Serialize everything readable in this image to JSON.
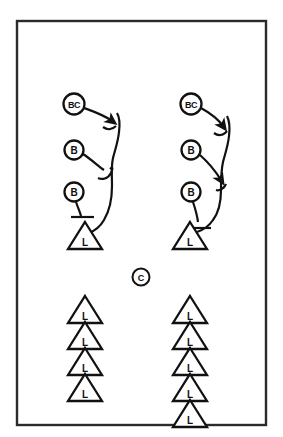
{
  "diagram": {
    "background_color": "#ffffff",
    "line_color": "#111111",
    "frame_color": "#2b2b2b",
    "frame": {
      "x": 17,
      "y": 21,
      "width": 249,
      "height": 404
    },
    "groups": {
      "left_stack_label": "Left blocker stack",
      "right_stack_label": "Right blocker stack",
      "center_label": "Center",
      "left_line_label": "Left line of linemen",
      "right_line_label": "Right line of linemen"
    },
    "nodes": {
      "left_stack": [
        {
          "id": "left-bc",
          "label": "BC",
          "shape": "circle",
          "cx": 74,
          "cy": 104,
          "r": 10.5
        },
        {
          "id": "left-b1",
          "label": "B",
          "shape": "circle",
          "cx": 74,
          "cy": 150,
          "r": 9.5
        },
        {
          "id": "left-b2",
          "label": "B",
          "shape": "circle",
          "cx": 74,
          "cy": 192,
          "r": 9.5
        },
        {
          "id": "left-l",
          "label": "L",
          "shape": "triangle",
          "cx": 85,
          "cy": 236,
          "size": 17
        }
      ],
      "right_stack": [
        {
          "id": "right-bc",
          "label": "BC",
          "shape": "circle",
          "cx": 191,
          "cy": 104,
          "r": 10.5
        },
        {
          "id": "right-b1",
          "label": "B",
          "shape": "circle",
          "cx": 191,
          "cy": 150,
          "r": 9.5
        },
        {
          "id": "right-b2",
          "label": "B",
          "shape": "circle",
          "cx": 191,
          "cy": 192,
          "r": 9.5
        },
        {
          "id": "right-l",
          "label": "L",
          "shape": "triangle",
          "cx": 190,
          "cy": 236,
          "size": 17
        }
      ],
      "center": {
        "id": "center-c",
        "label": "C",
        "shape": "circle",
        "cx": 141,
        "cy": 277,
        "r": 8.5
      },
      "left_line": [
        {
          "id": "left-line-1",
          "label": "L",
          "shape": "triangle",
          "cx": 85,
          "cy": 310,
          "size": 17
        },
        {
          "id": "left-line-2",
          "label": "L",
          "shape": "triangle",
          "cx": 85,
          "cy": 336,
          "size": 17
        },
        {
          "id": "left-line-3",
          "label": "L",
          "shape": "triangle",
          "cx": 85,
          "cy": 362,
          "size": 17
        },
        {
          "id": "left-line-4",
          "label": "L",
          "shape": "triangle",
          "cx": 85,
          "cy": 388,
          "size": 17
        }
      ],
      "right_line": [
        {
          "id": "right-line-1",
          "label": "L",
          "shape": "triangle",
          "cx": 190,
          "cy": 310,
          "size": 17
        },
        {
          "id": "right-line-2",
          "label": "L",
          "shape": "triangle",
          "cx": 190,
          "cy": 336,
          "size": 17
        },
        {
          "id": "right-line-3",
          "label": "L",
          "shape": "triangle",
          "cx": 190,
          "cy": 362,
          "size": 17
        },
        {
          "id": "right-line-4",
          "label": "L",
          "shape": "triangle",
          "cx": 190,
          "cy": 388,
          "size": 17
        },
        {
          "id": "right-line-5",
          "label": "L",
          "shape": "triangle",
          "cx": 190,
          "cy": 414,
          "size": 17
        }
      ]
    },
    "routes": {
      "left": {
        "bc_route": {
          "name": "left-bc-route",
          "has_arrowhead": true
        },
        "b1_route": {
          "name": "left-b1-route",
          "has_arrowhead": false
        },
        "b2_route": {
          "name": "left-b2-route",
          "has_arrowhead": false
        },
        "spine": {
          "name": "left-spine",
          "has_arrowhead": false
        }
      },
      "right": {
        "bc_route": {
          "name": "right-bc-route",
          "has_arrowhead": true
        },
        "b1_route": {
          "name": "right-b1-route",
          "has_arrowhead": true
        },
        "b2_route": {
          "name": "right-b2-route",
          "has_arrowhead": false
        },
        "spine": {
          "name": "right-spine",
          "has_arrowhead": false
        }
      }
    },
    "counts": {
      "left_line_triangles": 4,
      "right_line_triangles": 5,
      "circles_per_stack": 3
    }
  }
}
